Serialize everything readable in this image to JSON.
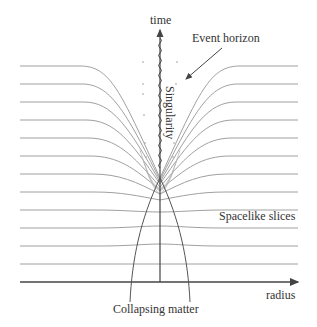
{
  "diagram": {
    "labels": {
      "time_axis": "time",
      "radius_axis": "radius",
      "event_horizon": "Event horizon",
      "singularity": "Singularity",
      "spacelike_slices": "Spacelike slices",
      "collapsing_matter": "Collapsing matter"
    },
    "slices": {
      "count": 12,
      "y_left": [
        66,
        84,
        102,
        120,
        138,
        156,
        174,
        192,
        210,
        228,
        246,
        264
      ]
    },
    "colors": {
      "axis": "#444444",
      "slice": "#9a9a9a",
      "singularity": "#444444",
      "matter": "#555555",
      "text": "#333333"
    }
  }
}
